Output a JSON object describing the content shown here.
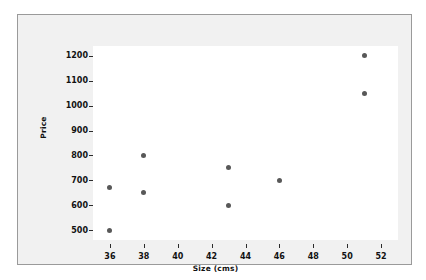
{
  "chart_data": {
    "type": "scatter",
    "title": "",
    "xlabel": "Size (cms)",
    "ylabel": "Price",
    "xlim": [
      35,
      53
    ],
    "ylim": [
      460,
      1240
    ],
    "xticks": [
      36,
      38,
      40,
      42,
      44,
      46,
      48,
      50,
      52
    ],
    "yticks": [
      500,
      600,
      700,
      800,
      900,
      1000,
      1100,
      1200
    ],
    "grid": false,
    "legend": null,
    "marker": {
      "shape": "circle",
      "color": "#585858",
      "size": 5
    },
    "points": [
      {
        "x": 36,
        "y": 500
      },
      {
        "x": 36,
        "y": 670
      },
      {
        "x": 38,
        "y": 650
      },
      {
        "x": 38,
        "y": 800
      },
      {
        "x": 43,
        "y": 600
      },
      {
        "x": 43,
        "y": 750
      },
      {
        "x": 46,
        "y": 700
      },
      {
        "x": 51,
        "y": 1050
      },
      {
        "x": 51,
        "y": 1200
      }
    ]
  },
  "figure": {
    "background_color": "#f1f1f1",
    "plot_background_color": "#ffffff",
    "border_color": "#9a9a9a"
  }
}
